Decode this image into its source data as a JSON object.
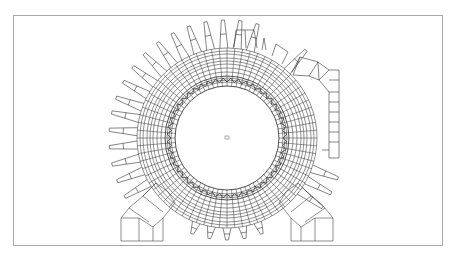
{
  "figure": {
    "colors": {
      "background": "#ffffff",
      "frame": "#a8a8a8",
      "mesh_line": "#222222",
      "mesh_light": "#6a6a6a"
    },
    "center": {
      "x": 227,
      "y": 138
    },
    "radii": {
      "bore": 52,
      "air_gap_inner": 56,
      "stator_teeth": 62,
      "stator_yoke_inner": 70,
      "stator_outer": 80,
      "frame_inner": 84,
      "frame_outer": 90,
      "fin_tip": 118
    },
    "fin_count": 36,
    "components": [
      "stator core mesh",
      "housing with cooling fins",
      "terminal box",
      "left mounting foot",
      "right mounting foot",
      "center marker"
    ]
  }
}
